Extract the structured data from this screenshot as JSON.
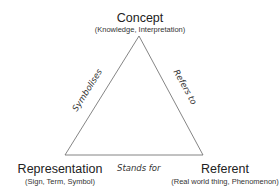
{
  "diagram": {
    "type": "semiotic-triangle",
    "nodes": {
      "concept": {
        "title": "Concept",
        "subtitle": "(Knowledge, Interpretation)"
      },
      "representation": {
        "title": "Representation",
        "subtitle": "(Sign, Term, Symbol)"
      },
      "referent": {
        "title": "Referent",
        "subtitle": "(Real world thing, Phenomenon)"
      }
    },
    "edges": {
      "left": {
        "label": "Symbolises",
        "from": "representation",
        "to": "concept"
      },
      "right": {
        "label": "Refers to",
        "from": "concept",
        "to": "referent"
      },
      "bottom": {
        "label": "Stands for",
        "from": "representation",
        "to": "referent"
      }
    },
    "line_color": "#555555"
  }
}
